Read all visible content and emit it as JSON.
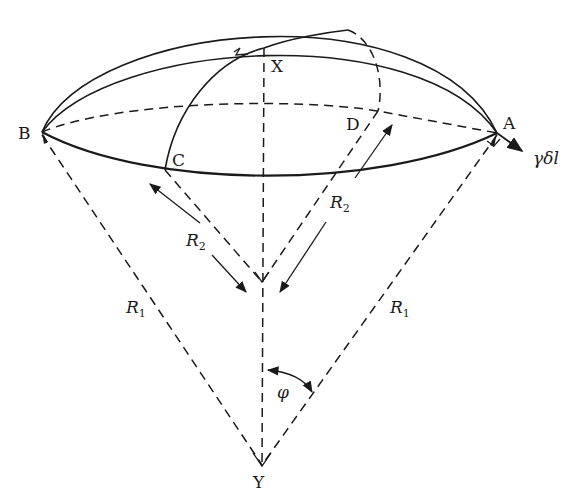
{
  "diagram": {
    "points": {
      "A": "A",
      "B": "B",
      "C": "C",
      "D": "D",
      "X": "X",
      "Y": "Y"
    },
    "labels": {
      "force": "γδl",
      "radius_outer_left": "R",
      "radius_outer_left_sub": "1",
      "radius_outer_right": "R",
      "radius_outer_right_sub": "1",
      "radius_inner_left": "R",
      "radius_inner_left_sub": "2",
      "radius_inner_right": "R",
      "radius_inner_right_sub": "2",
      "angle": "φ"
    }
  }
}
